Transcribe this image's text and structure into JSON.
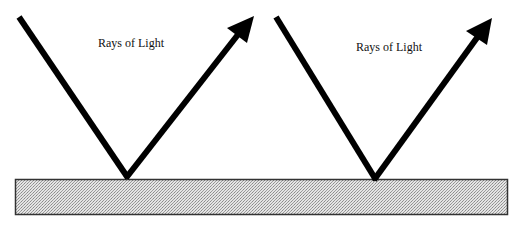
{
  "diagram": {
    "title": "",
    "colors": {
      "ray": "#000000",
      "surface_fill": "#cfcfcf",
      "surface_border": "#333333",
      "background": "#ffffff"
    },
    "rays": [
      {
        "label": "Rays of Light",
        "incident_start": [
          19,
          17
        ],
        "vertex": [
          128,
          178
        ],
        "reflected_tip": [
          254,
          17
        ]
      },
      {
        "label": "Rays of Light",
        "incident_start": [
          276,
          17
        ],
        "vertex": [
          376,
          180
        ],
        "reflected_tip": [
          492,
          20
        ]
      }
    ],
    "surface": {
      "x": 15,
      "y": 180,
      "width": 492,
      "height": 35,
      "pattern": "stipple"
    }
  }
}
